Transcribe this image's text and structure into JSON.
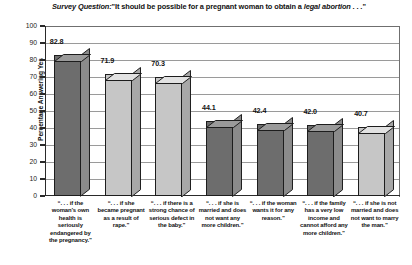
{
  "chart_data": {
    "type": "bar",
    "title_parts": {
      "lead_italic": "Survey Question:",
      "quote_open": "\"It should be possible for a pregnant woman to obtain a ",
      "emphasis_italic": "legal abortion . . .",
      "quote_close": "\""
    },
    "xlabel": "",
    "ylabel": "Percentage Answering Yes",
    "ylim": [
      0,
      100
    ],
    "yticks": [
      100,
      90,
      80,
      70,
      60,
      50,
      40,
      30,
      20,
      10,
      0
    ],
    "grid": true,
    "legend": "none",
    "categories": [
      "“. . . if the woman’s own health is seriously endangered by the pregnancy.”",
      "“. . . if she became pregnant as a result of rape.”",
      "“. . . if there is a strong chance of serious defect in the baby.”",
      "“. . . if she is married and does not want any more children.”",
      "“. . . if the woman wants it for any reason.”",
      "“. . . if the family has a very low income and cannot afford any more children.”",
      "“. . . if she is not married and does not want to marry the man.”"
    ],
    "values": [
      82.8,
      71.9,
      70.3,
      44.1,
      42.4,
      42.0,
      40.7
    ],
    "value_labels": [
      "82.8",
      "71.9",
      "70.3",
      "44.1",
      "42.4",
      "42.0",
      "40.7"
    ],
    "bar_shades": [
      "dark",
      "light",
      "light",
      "dark",
      "dark",
      "dark",
      "light"
    ],
    "colors": {
      "bar_dark_front": "#6d6d6d",
      "bar_dark_top": "#9a9a9a",
      "bar_dark_side": "#8b8b8b",
      "bar_light_front": "#c6c6c6",
      "bar_light_top": "#e2e2e2",
      "bar_light_side": "#a8a8a8",
      "axis": "#2a2a2a",
      "grid": "#9a9a9a",
      "background": "#ffffff"
    }
  }
}
